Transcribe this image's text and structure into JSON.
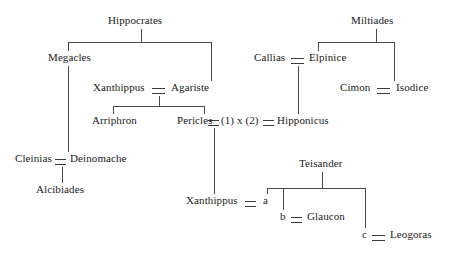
{
  "diagram": {
    "type": "family-tree",
    "background_color": "#ffffff",
    "line_color": "#4a4a4a",
    "text_color": "#1a1a1a",
    "marriage_symbol": "=",
    "width": 450,
    "height": 255
  },
  "people": {
    "hippocrates": "Hippocrates",
    "megacles": "Megacles",
    "xanthippus_elder": "Xanthippus",
    "agariste": "Agariste",
    "arriphron": "Arriphron",
    "pericles": "Pericles",
    "marriage_note": "(1) x (2)",
    "hipponicus": "Hipponicus",
    "miltiades": "Miltiades",
    "callias": "Callias",
    "elpinice": "Elpinice",
    "cimon": "Cimon",
    "isodice": "Isodice",
    "cleinias": "Cleinias",
    "deinomache": "Deinomache",
    "alcibiades": "Alcibiades",
    "xanthippus_younger": "Xanthippus",
    "child_a": "a",
    "teisander": "Teisander",
    "child_b": "b",
    "glaucon": "Glaucon",
    "child_c": "c",
    "leogoras": "Leogoras"
  }
}
